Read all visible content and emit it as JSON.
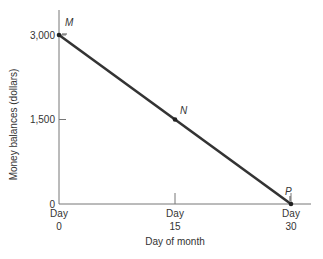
{
  "chart_data": {
    "type": "line",
    "title": "",
    "xlabel": "Day of month",
    "ylabel": "Money balances (dollars)",
    "xlim": [
      0,
      30
    ],
    "ylim": [
      0,
      3000
    ],
    "grid": false,
    "legend": "none",
    "x_ticks": [
      {
        "value": 0,
        "line1": "Day",
        "line2": "0"
      },
      {
        "value": 15,
        "line1": "Day",
        "line2": "15"
      },
      {
        "value": 30,
        "line1": "Day",
        "line2": "30"
      }
    ],
    "y_ticks": [
      {
        "value": 0,
        "label": "0"
      },
      {
        "value": 1500,
        "label": "1,500"
      },
      {
        "value": 3000,
        "label": "3,000"
      }
    ],
    "series": [
      {
        "name": "Money balance",
        "x": [
          0,
          30
        ],
        "y": [
          3000,
          0
        ],
        "color": "#333333"
      }
    ],
    "points": [
      {
        "label": "M",
        "x": 0,
        "y": 3000
      },
      {
        "label": "N",
        "x": 15,
        "y": 1500
      },
      {
        "label": "P",
        "x": 30,
        "y": 0
      }
    ]
  }
}
